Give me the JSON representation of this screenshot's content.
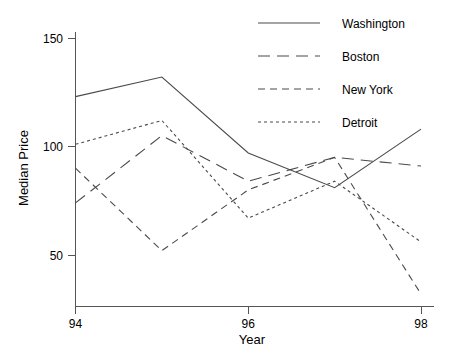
{
  "chart_data": {
    "type": "line",
    "title": "",
    "xlabel": "Year",
    "ylabel": "Median Price",
    "x": [
      94,
      95,
      96,
      97,
      98
    ],
    "xtick_values": [
      94,
      96,
      98
    ],
    "xtick_labels": [
      "94",
      "96",
      "98"
    ],
    "ytick_values": [
      50,
      100,
      150
    ],
    "ytick_labels": [
      "50",
      "100",
      "150"
    ],
    "xlim": [
      94,
      98
    ],
    "ylim": [
      30,
      155
    ],
    "grid": false,
    "legend_position": "top-right",
    "series": [
      {
        "name": "Washington",
        "style": "solid",
        "dash": "none",
        "color": "#4a4a4a",
        "values": [
          123,
          132,
          97,
          81,
          108
        ]
      },
      {
        "name": "Boston",
        "style": "long-dash",
        "dash": "12,7",
        "color": "#4a4a4a",
        "values": [
          74,
          105,
          84,
          95,
          91
        ]
      },
      {
        "name": "New York",
        "style": "medium-dash",
        "dash": "7,5",
        "color": "#4a4a4a",
        "values": [
          90,
          52,
          80,
          95,
          32
        ]
      },
      {
        "name": "Detroit",
        "style": "short-dash",
        "dash": "3,3",
        "color": "#4a4a4a",
        "values": [
          101,
          112,
          67,
          84,
          56
        ]
      }
    ]
  },
  "axes": {
    "y_title": "Median Price",
    "x_title": "Year"
  },
  "legend": {
    "entries": [
      {
        "label": "Washington"
      },
      {
        "label": "Boston"
      },
      {
        "label": "New York"
      },
      {
        "label": "Detroit"
      }
    ]
  }
}
